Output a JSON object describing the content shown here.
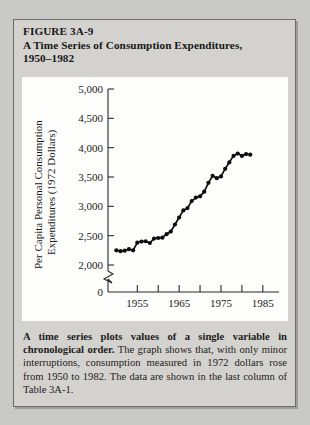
{
  "figure": {
    "label": "FIGURE 3A-9",
    "title_line_1": "A Time Series of Consumption Expenditures,",
    "title_line_2": "1950–1982"
  },
  "caption": {
    "lead": "A time series plots values of a single variable in chronological order.",
    "body": " The graph shows that, with only minor interruptions, consumption measured in 1972 dollars rose from 1950 to 1982. The data are shown in the last column of Table 3A-1."
  },
  "chart_data": {
    "type": "line",
    "title": "A Time Series of Consumption Expenditures, 1950–1982",
    "xlabel": "",
    "ylabel": "Per Capita Personal Consumption Expenditures (1972 Dollars)",
    "ylabel_line_1": "Per Capita Personal Consumption",
    "ylabel_line_2": "Expenditures (1972 Dollars)",
    "ylim": [
      2000,
      5000
    ],
    "xlim": [
      1948,
      1986
    ],
    "yticks": [
      2000,
      2500,
      3000,
      3500,
      4000,
      4500,
      5000
    ],
    "ytick_labels": [
      "2,000",
      "2,500",
      "3,000",
      "3,500",
      "4,000",
      "4,500",
      "5,000"
    ],
    "y_origin_label": "0",
    "axis_break": true,
    "xticks": [
      1955,
      1960,
      1965,
      1970,
      1975,
      1980,
      1985
    ],
    "xtick_labels": [
      "1955",
      "",
      "1965",
      "",
      "1975",
      "",
      "1985"
    ],
    "grid": false,
    "legend": null,
    "markers": "filled-circle",
    "x": [
      1950,
      1951,
      1952,
      1953,
      1954,
      1955,
      1956,
      1957,
      1958,
      1959,
      1960,
      1961,
      1962,
      1963,
      1964,
      1965,
      1966,
      1967,
      1968,
      1969,
      1970,
      1971,
      1972,
      1973,
      1974,
      1975,
      1976,
      1977,
      1978,
      1979,
      1980,
      1981,
      1982
    ],
    "values": [
      2250,
      2235,
      2245,
      2270,
      2250,
      2380,
      2400,
      2405,
      2375,
      2450,
      2460,
      2465,
      2525,
      2570,
      2690,
      2810,
      2930,
      2970,
      3090,
      3150,
      3170,
      3250,
      3400,
      3520,
      3480,
      3510,
      3640,
      3750,
      3860,
      3900,
      3860,
      3890,
      3880
    ],
    "series": [
      {
        "name": "Per capita personal consumption expenditures (1972 dollars)",
        "values": [
          2250,
          2235,
          2245,
          2270,
          2250,
          2380,
          2400,
          2405,
          2375,
          2450,
          2460,
          2465,
          2525,
          2570,
          2690,
          2810,
          2930,
          2970,
          3090,
          3150,
          3170,
          3250,
          3400,
          3520,
          3480,
          3510,
          3640,
          3750,
          3860,
          3900,
          3860,
          3890,
          3880
        ]
      }
    ]
  },
  "colors": {
    "page_background": "#c9c9c6",
    "figure_background": "#d4d2ce",
    "panel_background": "#fdfdfb",
    "ink": "#1a1a1a",
    "series": "#0d0d0d"
  }
}
